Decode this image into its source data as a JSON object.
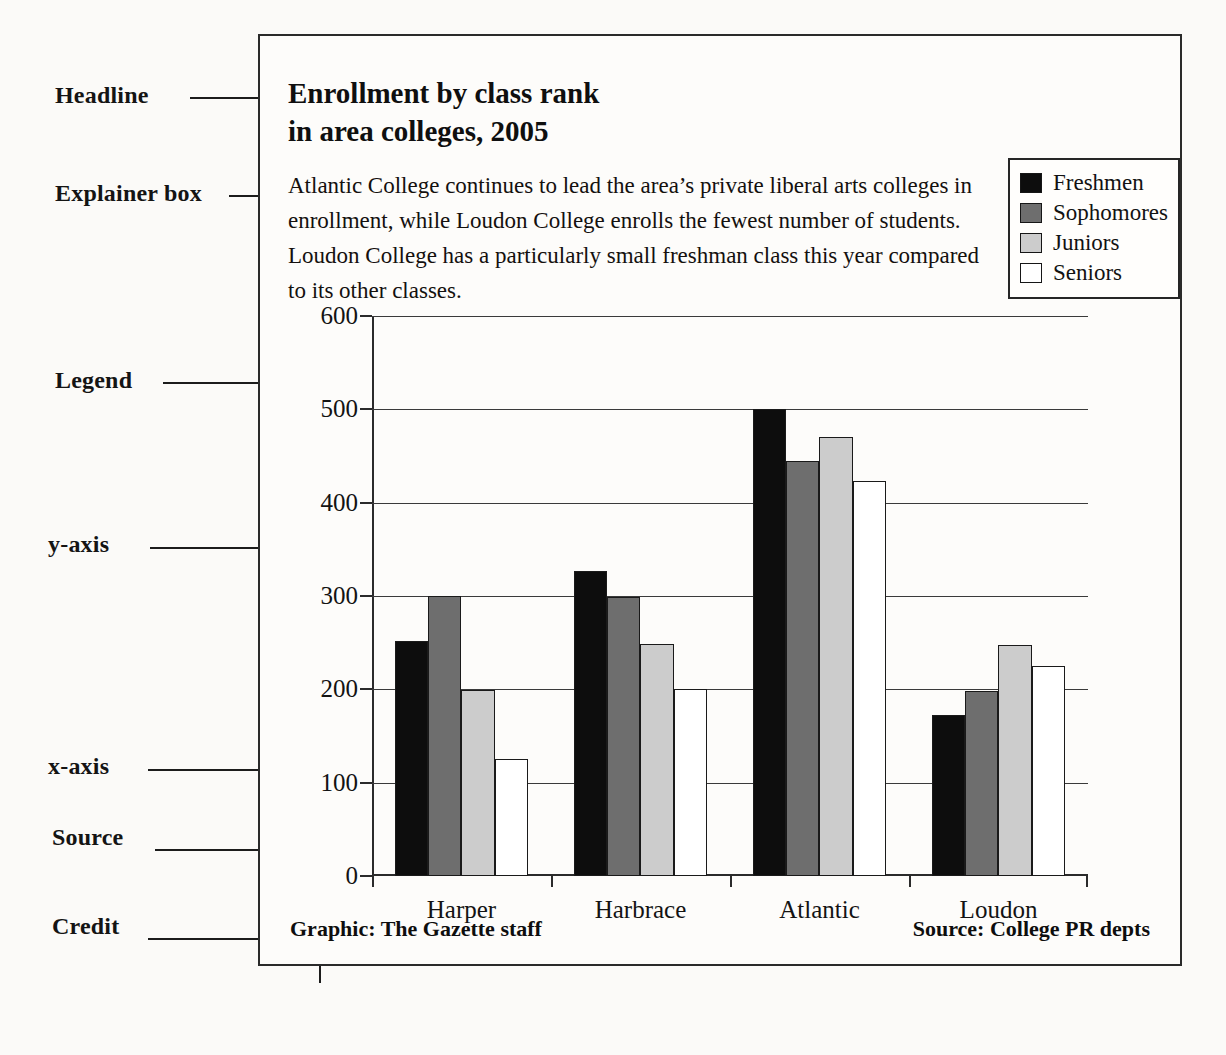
{
  "annotations": [
    {
      "key": "headline",
      "label": "Headline"
    },
    {
      "key": "explainer_box",
      "label": "Explainer box"
    },
    {
      "key": "legend",
      "label": "Legend"
    },
    {
      "key": "y_axis",
      "label": "y-axis"
    },
    {
      "key": "x_axis",
      "label": "x-axis"
    },
    {
      "key": "source",
      "label": "Source"
    },
    {
      "key": "credit",
      "label": "Credit"
    }
  ],
  "graphic": {
    "headline_lines": [
      "Enrollment by class rank",
      "in area colleges, 2005"
    ],
    "explainer_lines": [
      "Atlantic College continues to lead the area’s private liberal arts colleges in",
      "enrollment, while Loudon College enrolls the fewest number of students.",
      "Loudon College has a particularly small freshman class this year compared",
      "to its other classes."
    ],
    "credit": "Graphic: The Gazette staff",
    "source": "Source: College PR depts"
  },
  "chart_data": {
    "type": "bar",
    "title": "Enrollment by class rank in area colleges, 2005",
    "xlabel": "",
    "ylabel": "",
    "ylim": [
      0,
      600
    ],
    "yticks": [
      0,
      100,
      200,
      300,
      400,
      500,
      600
    ],
    "ytick_labels": [
      "0",
      "100",
      "200",
      "300",
      "400",
      "500",
      "600"
    ],
    "grid": true,
    "legend_position": "upper right",
    "categories": [
      "Harper",
      "Harbrace",
      "Atlantic",
      "Loudon"
    ],
    "series": [
      {
        "name": "Freshmen",
        "color": "#0d0d0d",
        "values": [
          252,
          327,
          500,
          172
        ]
      },
      {
        "name": "Sophomores",
        "color": "#6e6e6e",
        "values": [
          300,
          299,
          445,
          198
        ]
      },
      {
        "name": "Juniors",
        "color": "#cccccc",
        "values": [
          199,
          249,
          470,
          248
        ]
      },
      {
        "name": "Seniors",
        "color": "#ffffff",
        "values": [
          125,
          200,
          423,
          225
        ]
      }
    ]
  }
}
